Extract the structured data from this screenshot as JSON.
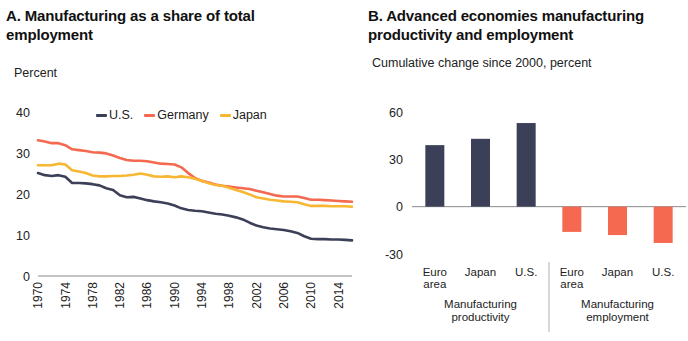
{
  "figure": {
    "background": "#ffffff"
  },
  "panel_a": {
    "title": "A. Manufacturing as a share of total employment",
    "axis_note": "Percent",
    "legend": [
      {
        "label": "U.S.",
        "color": "#3b4058"
      },
      {
        "label": "Germany",
        "color": "#f4694f"
      },
      {
        "label": "Japan",
        "color": "#f7b733"
      }
    ],
    "chart_data": {
      "type": "line",
      "title": "A. Manufacturing as a share of total employment",
      "xlabel": "",
      "ylabel": "Percent",
      "ylim": [
        0,
        40
      ],
      "yticks": [
        0,
        10,
        20,
        30,
        40
      ],
      "xlim": [
        1970,
        2016
      ],
      "xticks": [
        1970,
        1974,
        1978,
        1982,
        1986,
        1990,
        1994,
        1998,
        2002,
        2006,
        2010,
        2014
      ],
      "grid": false,
      "legend_position": "top-center",
      "x": [
        1970,
        1971,
        1972,
        1973,
        1974,
        1975,
        1976,
        1977,
        1978,
        1979,
        1980,
        1981,
        1982,
        1983,
        1984,
        1985,
        1986,
        1987,
        1988,
        1989,
        1990,
        1991,
        1992,
        1993,
        1994,
        1995,
        1996,
        1997,
        1998,
        1999,
        2000,
        2001,
        2002,
        2003,
        2004,
        2005,
        2006,
        2007,
        2008,
        2009,
        2010,
        2011,
        2012,
        2013,
        2014,
        2015,
        2016
      ],
      "series": [
        {
          "name": "U.S.",
          "color": "#3b4058",
          "values": [
            25.1,
            24.6,
            24.4,
            24.6,
            24.2,
            22.7,
            22.7,
            22.6,
            22.4,
            22.1,
            21.4,
            21.0,
            19.7,
            19.2,
            19.3,
            18.9,
            18.5,
            18.2,
            18.0,
            17.7,
            17.2,
            16.5,
            16.1,
            15.9,
            15.8,
            15.5,
            15.2,
            15.0,
            14.7,
            14.3,
            13.8,
            13.0,
            12.3,
            11.9,
            11.6,
            11.4,
            11.2,
            10.9,
            10.5,
            9.7,
            9.1,
            9.0,
            9.0,
            8.9,
            8.9,
            8.8,
            8.7
          ]
        },
        {
          "name": "Germany",
          "color": "#f4694f",
          "values": [
            33.1,
            32.8,
            32.4,
            32.4,
            31.9,
            30.9,
            30.7,
            30.5,
            30.2,
            30.1,
            29.9,
            29.4,
            28.8,
            28.3,
            28.1,
            28.1,
            28.0,
            27.7,
            27.4,
            27.3,
            27.2,
            26.5,
            25.1,
            23.9,
            23.2,
            22.8,
            22.3,
            22.0,
            21.8,
            21.6,
            21.4,
            21.2,
            20.8,
            20.4,
            20.0,
            19.6,
            19.4,
            19.4,
            19.4,
            19.0,
            18.6,
            18.6,
            18.5,
            18.4,
            18.3,
            18.2,
            18.1
          ]
        },
        {
          "name": "Japan",
          "color": "#f7b733",
          "values": [
            27.0,
            27.0,
            27.0,
            27.4,
            27.2,
            25.8,
            25.5,
            25.1,
            24.5,
            24.3,
            24.3,
            24.4,
            24.4,
            24.5,
            24.7,
            25.0,
            24.7,
            24.3,
            24.2,
            24.3,
            24.1,
            24.3,
            24.1,
            23.7,
            23.2,
            22.6,
            22.2,
            22.0,
            21.5,
            21.0,
            20.5,
            19.9,
            19.2,
            18.9,
            18.6,
            18.4,
            18.2,
            18.1,
            18.0,
            17.5,
            17.1,
            17.1,
            17.1,
            17.0,
            17.0,
            17.0,
            16.9
          ]
        }
      ]
    }
  },
  "panel_b": {
    "title": "B. Advanced economies manufacturing productivity and employment",
    "axis_note": "Cumulative change since 2000, percent",
    "chart_data": {
      "type": "bar",
      "title": "B. Advanced economies manufacturing productivity and employment",
      "ylabel": "Cumulative change since 2000, percent",
      "ylim": [
        -30,
        60
      ],
      "yticks": [
        -30,
        0,
        30,
        60
      ],
      "grid": false,
      "categories": [
        "Euro area",
        "Japan",
        "U.S.",
        "Euro area",
        "Japan",
        "U.S."
      ],
      "values": [
        39,
        43,
        53,
        -16,
        -18,
        -23
      ],
      "bar_colors": [
        "#3b4058",
        "#3b4058",
        "#3b4058",
        "#f4694f",
        "#f4694f",
        "#f4694f"
      ],
      "groups": [
        {
          "label": "Manufacturing productivity",
          "categories": [
            "Euro area",
            "Japan",
            "U.S."
          ],
          "values": [
            39,
            43,
            53
          ],
          "color": "#3b4058"
        },
        {
          "label": "Manufacturing employment",
          "categories": [
            "Euro area",
            "Japan",
            "U.S."
          ],
          "values": [
            -16,
            -18,
            -23
          ],
          "color": "#f4694f"
        }
      ]
    }
  }
}
